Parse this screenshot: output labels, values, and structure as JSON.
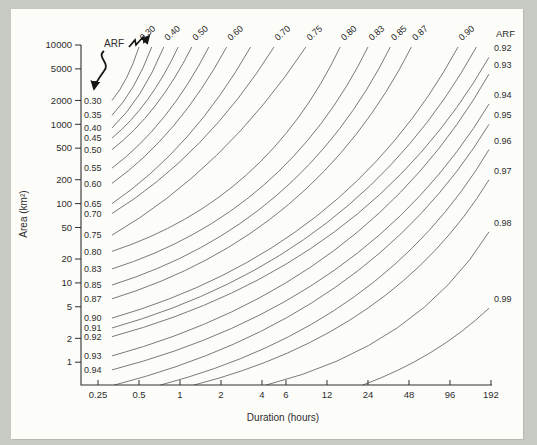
{
  "figure": {
    "right_header": "ARF",
    "annotation_label": "ARF"
  },
  "colors": {
    "page_background": "#c7cac3",
    "panel_background": "#fcfcf9",
    "contour_line": "#6b6b6b",
    "axis_line": "#2f2f2f",
    "text": "#2d2d2d",
    "annotation": "#161616"
  },
  "chart_data": {
    "type": "contour",
    "title": "",
    "x_axis": {
      "label": "Duration (hours)",
      "scale": "log",
      "tick_values": [
        0.25,
        0.5,
        1,
        2,
        4,
        6,
        12,
        24,
        48,
        96,
        192
      ],
      "tick_labels": [
        "0.25",
        "0.5",
        "1",
        "2",
        "4",
        "6",
        "12",
        "24",
        "48",
        "96",
        "192"
      ],
      "range": [
        0.19,
        192
      ]
    },
    "y_axis": {
      "label": "Area (km²)",
      "scale": "log",
      "tick_values": [
        10000,
        5000,
        2000,
        1000,
        500,
        200,
        100,
        50,
        20,
        10,
        5,
        2,
        1
      ],
      "tick_labels": [
        "10000",
        "5000",
        "2000",
        "1000",
        "500",
        "200",
        "100",
        "50",
        "20",
        "10",
        "5",
        "2",
        "1"
      ],
      "range": [
        0.52,
        10000
      ]
    },
    "grid": false,
    "contours": [
      {
        "arf": "0.30",
        "start": {
          "edge": "left",
          "area": 2000
        },
        "end": {
          "edge": "top",
          "duration": 0.5
        },
        "end_labeled": true
      },
      {
        "arf": "0.35",
        "start": {
          "edge": "left",
          "area": 1300
        },
        "end": {
          "edge": "top",
          "duration": 0.62
        },
        "end_labeled": false
      },
      {
        "arf": "0.40",
        "start": {
          "edge": "left",
          "area": 900
        },
        "end": {
          "edge": "top",
          "duration": 0.76
        },
        "end_labeled": true
      },
      {
        "arf": "0.45",
        "start": {
          "edge": "left",
          "area": 670
        },
        "end": {
          "edge": "top",
          "duration": 0.97
        },
        "end_labeled": false
      },
      {
        "arf": "0.50",
        "start": {
          "edge": "left",
          "area": 480
        },
        "end": {
          "edge": "top",
          "duration": 1.22
        },
        "end_labeled": true
      },
      {
        "arf": "0.55",
        "start": {
          "edge": "left",
          "area": 280
        },
        "end": {
          "edge": "top",
          "duration": 1.63
        },
        "end_labeled": false
      },
      {
        "arf": "0.60",
        "start": {
          "edge": "left",
          "area": 180
        },
        "end": {
          "edge": "top",
          "duration": 2.2
        },
        "end_labeled": true
      },
      {
        "arf": "0.65",
        "start": {
          "edge": "left",
          "area": 100
        },
        "end": {
          "edge": "top",
          "duration": 3.3
        },
        "end_labeled": false
      },
      {
        "arf": "0.70",
        "start": {
          "edge": "left",
          "area": 75
        },
        "end": {
          "edge": "top",
          "duration": 4.9
        },
        "end_labeled": true
      },
      {
        "arf": "0.75",
        "start": {
          "edge": "left",
          "area": 40
        },
        "end": {
          "edge": "top",
          "duration": 8.4
        },
        "end_labeled": true
      },
      {
        "arf": "0.80",
        "start": {
          "edge": "left",
          "area": 25
        },
        "end": {
          "edge": "top",
          "duration": 15
        },
        "end_labeled": true
      },
      {
        "arf": "0.83",
        "start": {
          "edge": "left",
          "area": 15
        },
        "end": {
          "edge": "top",
          "duration": 24
        },
        "end_labeled": true
      },
      {
        "arf": "0.85",
        "start": {
          "edge": "left",
          "area": 9.4
        },
        "end": {
          "edge": "top",
          "duration": 35
        },
        "end_labeled": true
      },
      {
        "arf": "0.87",
        "start": {
          "edge": "left",
          "area": 6.3
        },
        "end": {
          "edge": "top",
          "duration": 50
        },
        "end_labeled": true
      },
      {
        "arf": "0.90",
        "start": {
          "edge": "left",
          "area": 3.6
        },
        "end": {
          "edge": "top",
          "duration": 110
        },
        "end_labeled": true
      },
      {
        "arf": "0.91",
        "start": {
          "edge": "left",
          "area": 2.7
        },
        "end": {
          "edge": "top",
          "duration": 150
        },
        "end_labeled": false
      },
      {
        "arf": "0.92",
        "start": {
          "edge": "left",
          "area": 2.1
        },
        "end": {
          "edge": "right",
          "area": 7000
        },
        "end_labeled": true
      },
      {
        "arf": "0.93",
        "start": {
          "edge": "left",
          "area": 1.2
        },
        "end": {
          "edge": "right",
          "area": 4300
        },
        "end_labeled": true
      },
      {
        "arf": "0.94",
        "start": {
          "edge": "left",
          "area": 0.8
        },
        "end": {
          "edge": "right",
          "area": 1800
        },
        "end_labeled": true
      },
      {
        "arf": "0.95",
        "start": {
          "edge": "bottom",
          "duration": 0.33
        },
        "end": {
          "edge": "right",
          "area": 1000
        },
        "end_labeled": true
      },
      {
        "arf": "0.96",
        "start": {
          "edge": "bottom",
          "duration": 0.72
        },
        "end": {
          "edge": "right",
          "area": 480
        },
        "end_labeled": true
      },
      {
        "arf": "0.97",
        "start": {
          "edge": "bottom",
          "duration": 1.27
        },
        "end": {
          "edge": "right",
          "area": 200
        },
        "end_labeled": true
      },
      {
        "arf": "0.98",
        "start": {
          "edge": "bottom",
          "duration": 4.3
        },
        "end": {
          "edge": "right",
          "area": 44
        },
        "end_labeled": true
      },
      {
        "arf": "0.99",
        "start": {
          "edge": "bottom",
          "duration": 22
        },
        "end": {
          "edge": "right",
          "area": 4.8
        },
        "end_labeled": true
      }
    ]
  }
}
